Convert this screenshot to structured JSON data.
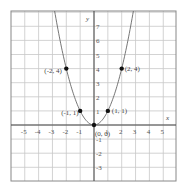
{
  "chart_data": {
    "type": "line",
    "title": "",
    "xlabel": "x",
    "ylabel": "y",
    "function": "y = x^2",
    "xlim": [
      -6,
      6
    ],
    "ylim": [
      -4,
      8.2
    ],
    "grid": true,
    "x_ticks": [
      -5,
      -4,
      -3,
      -2,
      -1,
      1,
      2,
      3,
      4,
      5
    ],
    "y_ticks": [
      7,
      6,
      5,
      4,
      3,
      2,
      1,
      -1,
      -2,
      -3
    ],
    "series": [
      {
        "name": "y = x^2",
        "x": [
          -2.85,
          -2,
          -1,
          0,
          1,
          2,
          2.85
        ],
        "y": [
          8.12,
          4,
          1,
          0,
          1,
          4,
          8.12
        ]
      }
    ],
    "points": [
      {
        "x": -2,
        "y": 4,
        "label": "(-2, 4)"
      },
      {
        "x": -1,
        "y": 1,
        "label": "(-1, 1)"
      },
      {
        "x": 0,
        "y": 0,
        "label": "(0, 0)"
      },
      {
        "x": 1,
        "y": 1,
        "label": "(1, 1)"
      },
      {
        "x": 2,
        "y": 4,
        "label": "(2, 4)"
      }
    ]
  },
  "axes": {
    "x_label": "x",
    "y_label": "y"
  },
  "colors": {
    "grid": "#c8c8c8",
    "border": "#888888",
    "axis": "#444444",
    "curve": "#666666",
    "point": "#111111"
  }
}
